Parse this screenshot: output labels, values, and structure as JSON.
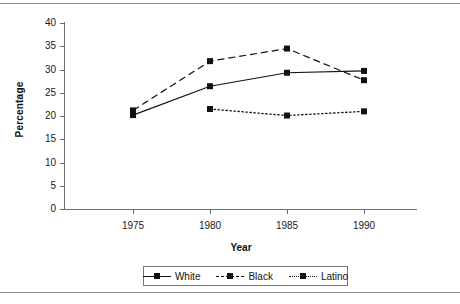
{
  "chart_data": {
    "type": "line",
    "title": "",
    "xlabel": "Year",
    "ylabel": "Percentage",
    "categories": [
      "1975",
      "1980",
      "1985",
      "1990"
    ],
    "x": [
      1975,
      1980,
      1985,
      1990
    ],
    "xlim": [
      1973,
      1992
    ],
    "ylim": [
      0,
      40
    ],
    "ytick_labels": [
      "0",
      "5",
      "10",
      "15",
      "20",
      "25",
      "30",
      "35",
      "40"
    ],
    "yticks": [
      0,
      5,
      10,
      15,
      20,
      25,
      30,
      35,
      40
    ],
    "grid": false,
    "legend_position": "below-center",
    "series": [
      {
        "name": "White",
        "line_style": "solid",
        "marker": "square",
        "color": "#111111",
        "values": [
          20.2,
          26.4,
          29.3,
          29.7
        ]
      },
      {
        "name": "Black",
        "line_style": "dashed",
        "marker": "square",
        "color": "#111111",
        "values": [
          21.2,
          31.8,
          34.5,
          27.7
        ]
      },
      {
        "name": "Latino",
        "line_style": "dotted",
        "marker": "square",
        "color": "#111111",
        "values": [
          null,
          21.5,
          20.1,
          21.0
        ]
      }
    ]
  },
  "axes": {
    "y_title": "Percentage",
    "x_title": "Year"
  },
  "legend": {
    "items": [
      {
        "label": "White"
      },
      {
        "label": "Black"
      },
      {
        "label": "Latino"
      }
    ]
  },
  "colors": {
    "ink": "#111111",
    "axis": "#6e6e6e",
    "rule": "#8c8c8c",
    "background": "#ffffff"
  }
}
